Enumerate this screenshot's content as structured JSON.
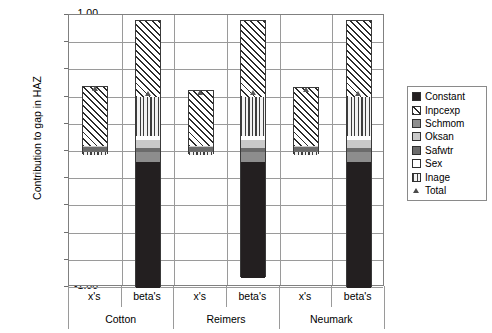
{
  "chart_data": {
    "type": "bar",
    "title": "",
    "subtitle": "",
    "xlabel": "",
    "ylabel": "Contribution to gap in HAZ",
    "ylim": [
      -1.0,
      1.0
    ],
    "ytick_labels": [
      "1.00",
      "0.80",
      "0.60",
      "0.40",
      "0.20",
      "0.00",
      "-0.20",
      "-0.40",
      "-0.60",
      "-0.80",
      "-1.00"
    ],
    "ytick_values": [
      1.0,
      0.8,
      0.6,
      0.4,
      0.2,
      0.0,
      -0.2,
      -0.4,
      -0.6,
      -0.8,
      -1.0
    ],
    "grid": true,
    "stacked": true,
    "legend_position": "right",
    "groups": [
      "Cotton",
      "Reimers",
      "Neumark"
    ],
    "subcategories": [
      "x's",
      "beta's"
    ],
    "categories": [
      "Cotton x's",
      "Cotton beta's",
      "Reimers x's",
      "Reimers beta's",
      "Neumark x's",
      "Neumark beta's"
    ],
    "series": [
      {
        "name": "Constant",
        "fill": "solid-black",
        "values": [
          0.0,
          -0.93,
          0.0,
          -0.855,
          0.0,
          -0.93
        ]
      },
      {
        "name": "Inpcexp",
        "fill": "diagonal-hatch",
        "values": [
          0.43,
          0.555,
          0.405,
          0.56,
          0.425,
          0.56
        ]
      },
      {
        "name": "Schmom",
        "fill": "solid-dark-gray",
        "values": [
          0.0,
          -0.07,
          0.0,
          -0.07,
          0.0,
          -0.07
        ]
      },
      {
        "name": "Oksan",
        "fill": "solid-light-gray",
        "values": [
          0.005,
          0.055,
          0.005,
          0.055,
          0.005,
          0.055
        ]
      },
      {
        "name": "Safwtr",
        "fill": "solid-mid-gray",
        "values": [
          0.04,
          0.03,
          0.04,
          0.03,
          0.04,
          0.03
        ]
      },
      {
        "name": "Sex",
        "fill": "white",
        "values": [
          0.0,
          0.03,
          0.0,
          0.03,
          0.0,
          0.03
        ]
      },
      {
        "name": "Inage",
        "fill": "vertical-hatch",
        "values": [
          -0.025,
          0.29,
          -0.025,
          0.29,
          -0.025,
          0.29
        ]
      }
    ],
    "total_markers": {
      "name": "Total",
      "values": [
        0.46,
        0.42,
        0.43,
        0.43,
        0.45,
        0.425
      ]
    },
    "bar_totals_top": [
      0.475,
      0.955,
      0.45,
      0.95,
      0.485,
      0.955
    ],
    "bar_totals_bottom": [
      -0.025,
      -1.0,
      -0.025,
      -0.925,
      -0.025,
      -1.0
    ]
  },
  "axis": {
    "ylabel": "Contribution to gap in HAZ",
    "yticks": [
      "1.00",
      "0.80",
      "0.60",
      "0.40",
      "0.20",
      "0.00",
      "-0.20",
      "-0.40",
      "-0.60",
      "-0.80",
      "-1.00"
    ]
  },
  "xaxis": {
    "cells": [
      "x's",
      "beta's",
      "x's",
      "beta's",
      "x's",
      "beta's"
    ],
    "groups": [
      "Cotton",
      "Reimers",
      "Neumark"
    ]
  },
  "legend": {
    "items": [
      {
        "label": "Constant"
      },
      {
        "label": "Inpcexp"
      },
      {
        "label": "Schmom"
      },
      {
        "label": "Oksan"
      },
      {
        "label": "Safwtr"
      },
      {
        "label": "Sex"
      },
      {
        "label": "Inage"
      },
      {
        "label": "Total"
      }
    ]
  },
  "colors": {
    "constant": "#231f20",
    "schmom": "#8d8d8d",
    "oksan": "#c9c9c9",
    "safwtr": "#6b6b6b",
    "sex": "#ffffff",
    "grid": "#9a9a9a",
    "frame": "#808080"
  }
}
